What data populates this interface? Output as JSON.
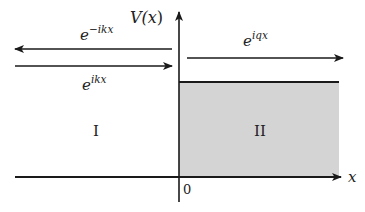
{
  "diagram": {
    "colors": {
      "line": "#1a1a1a",
      "region_fill": "#d4d4d4",
      "background": "#ffffff",
      "text": "#222222"
    },
    "axes": {
      "y_label": {
        "base": "V(",
        "var": "x",
        "close": ")"
      },
      "x_label": "x",
      "origin_label": "0"
    },
    "regions": [
      {
        "id": "I",
        "label": "I",
        "shaded": false
      },
      {
        "id": "II",
        "label": "II",
        "shaded": true
      }
    ],
    "waves": [
      {
        "name": "reflected",
        "base": "e",
        "exponent": "−ikx",
        "direction": "left",
        "region": "I"
      },
      {
        "name": "incident",
        "base": "e",
        "exponent": "ikx",
        "direction": "right",
        "region": "I"
      },
      {
        "name": "transmitted",
        "base": "e",
        "exponent": "iqx",
        "direction": "right",
        "region": "II"
      }
    ]
  }
}
